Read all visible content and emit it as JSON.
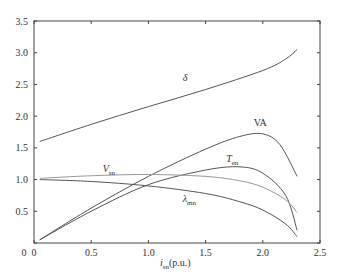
{
  "chart_data": {
    "type": "line",
    "title": "",
    "xlabel": "i_sn(p.u.)",
    "ylabel": "",
    "xlim": [
      0,
      2.5
    ],
    "ylim": [
      0,
      3.5
    ],
    "grid": false,
    "legend": "inline labels",
    "x_ticks": [
      "0",
      "0.5",
      "1.0",
      "1.5",
      "2.0",
      "2.5"
    ],
    "y_ticks": [
      "0",
      "0.5",
      "1.0",
      "1.5",
      "2.0",
      "2.5",
      "3.0",
      "3.5"
    ],
    "series": [
      {
        "name": "δ",
        "color": "#555555",
        "x": [
          0.05,
          0.5,
          1.0,
          1.5,
          2.0,
          2.2,
          2.3
        ],
        "values": [
          1.6,
          1.87,
          2.15,
          2.42,
          2.72,
          2.9,
          3.05
        ],
        "label_pos": [
          1.3,
          2.55
        ]
      },
      {
        "name": "VA",
        "color": "#555555",
        "x": [
          0.05,
          0.5,
          1.0,
          1.5,
          1.8,
          2.0,
          2.15,
          2.3
        ],
        "values": [
          0.05,
          0.55,
          1.05,
          1.48,
          1.68,
          1.72,
          1.55,
          1.05
        ],
        "label_pos": [
          1.92,
          1.85
        ]
      },
      {
        "name": "T_en",
        "color": "#555555",
        "x": [
          0.05,
          0.5,
          1.0,
          1.5,
          1.8,
          2.0,
          2.2,
          2.3
        ],
        "values": [
          0.05,
          0.5,
          0.92,
          1.15,
          1.2,
          1.1,
          0.75,
          0.2
        ],
        "label_pos": [
          1.68,
          1.28
        ]
      },
      {
        "name": "V_sn",
        "color": "#999999",
        "x": [
          0.05,
          0.5,
          1.0,
          1.5,
          1.8,
          2.0,
          2.2,
          2.3
        ],
        "values": [
          1.02,
          1.06,
          1.08,
          1.05,
          0.98,
          0.88,
          0.68,
          0.48
        ],
        "label_pos": [
          0.6,
          1.12
        ]
      },
      {
        "name": "λ_mn",
        "color": "#555555",
        "x": [
          0.05,
          0.5,
          1.0,
          1.5,
          1.8,
          2.0,
          2.2,
          2.3
        ],
        "values": [
          1.0,
          0.97,
          0.9,
          0.78,
          0.65,
          0.52,
          0.3,
          0.1
        ],
        "label_pos": [
          1.3,
          0.65
        ]
      }
    ]
  },
  "labels": {
    "xlabel_main": "i",
    "xlabel_sub": "sn",
    "xlabel_unit": "(p.u.)",
    "delta": "δ",
    "va": "VA",
    "ten_main": "T",
    "ten_sub": "en",
    "vsn_main": "V",
    "vsn_sub": "sn",
    "lambda_main": "λ",
    "lambda_sub": "mn"
  }
}
